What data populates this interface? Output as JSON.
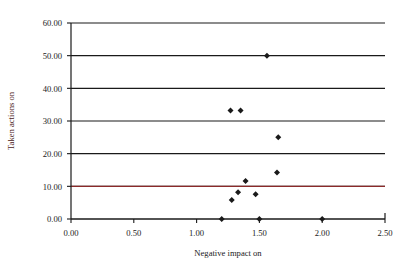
{
  "chart_data": {
    "type": "scatter",
    "title": "",
    "xlabel": "Negative impact on",
    "ylabel": "Taken actions on",
    "xlim": [
      0.0,
      2.5
    ],
    "ylim": [
      0.0,
      60.0
    ],
    "xticks": [
      0.0,
      0.5,
      1.0,
      1.5,
      2.0,
      2.5
    ],
    "xticklabels": [
      "0.00",
      "0.50",
      "1.00",
      "1.50",
      "2.00",
      "2.50"
    ],
    "yticks": [
      0.0,
      10.0,
      20.0,
      30.0,
      40.0,
      50.0,
      60.0
    ],
    "yticklabels": [
      "0.00",
      "10.00",
      "20.00",
      "30.00",
      "40.00",
      "50.00",
      "60.00"
    ],
    "grid": "horizontal",
    "legend": "none",
    "marker": "diamond",
    "marker_color": "#1a1a1a",
    "reference_line": {
      "axis": "y",
      "value": 10.0,
      "color": "#8b2a2a"
    },
    "points": [
      {
        "x": 1.2,
        "y": 0.0
      },
      {
        "x": 1.5,
        "y": 0.0
      },
      {
        "x": 2.0,
        "y": 0.0
      },
      {
        "x": 1.28,
        "y": 5.8
      },
      {
        "x": 1.33,
        "y": 8.2
      },
      {
        "x": 1.47,
        "y": 7.6
      },
      {
        "x": 1.39,
        "y": 11.6
      },
      {
        "x": 1.64,
        "y": 14.2
      },
      {
        "x": 1.65,
        "y": 25.0
      },
      {
        "x": 1.27,
        "y": 33.2
      },
      {
        "x": 1.35,
        "y": 33.2
      },
      {
        "x": 1.56,
        "y": 50.0
      }
    ]
  },
  "colors": {
    "axis": "#1a1a1a",
    "grid": "#1a1a1a",
    "marker": "#1a1a1a",
    "reference": "#8b2a2a",
    "background": "#ffffff"
  }
}
